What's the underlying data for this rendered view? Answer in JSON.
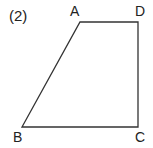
{
  "problem_number": "(2)",
  "shape": "trapezoid",
  "vertices": {
    "A": {
      "label": "A",
      "x": 80,
      "y": 22
    },
    "D": {
      "label": "D",
      "x": 138,
      "y": 22
    },
    "C": {
      "label": "C",
      "x": 138,
      "y": 127
    },
    "B": {
      "label": "B",
      "x": 22,
      "y": 127
    }
  },
  "colors": {
    "stroke": "#333333",
    "text": "#222222"
  }
}
